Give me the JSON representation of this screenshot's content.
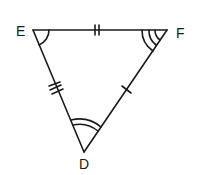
{
  "diagram": {
    "type": "triangle",
    "stroke_color": "#1a1a1a",
    "vertices": [
      {
        "name": "E",
        "x": 33,
        "y": 30
      },
      {
        "name": "F",
        "x": 167,
        "y": 30
      },
      {
        "name": "D",
        "x": 84,
        "y": 152
      }
    ],
    "labels": {
      "E": "E",
      "F": "F",
      "D": "D"
    },
    "side_marks": {
      "EF": 2,
      "ED": 3,
      "FD": 1
    },
    "angle_arcs": {
      "E": 1,
      "F": 3,
      "D": 2
    }
  }
}
